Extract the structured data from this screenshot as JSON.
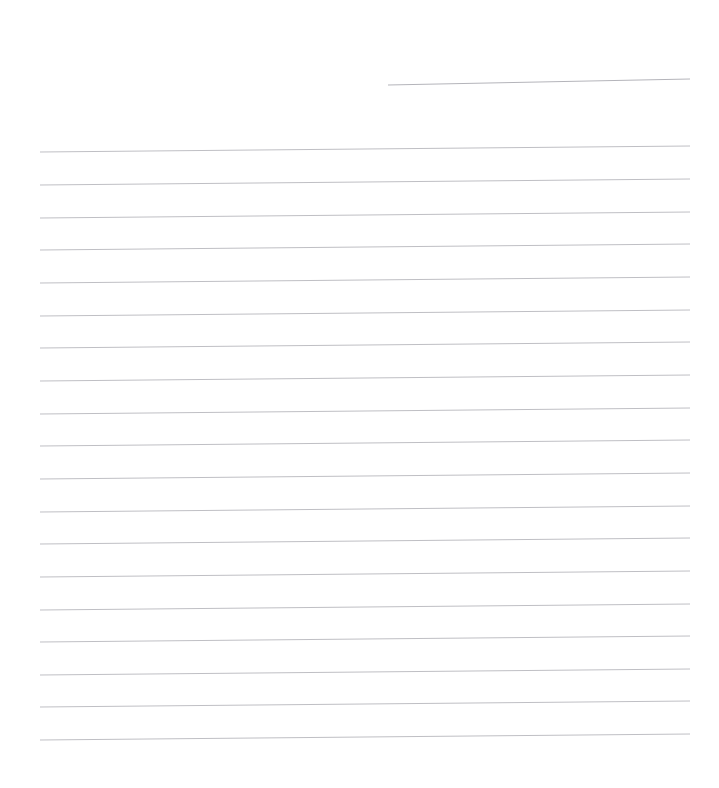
{
  "document": {
    "kind": "scanned-blank-ruled-paper",
    "title": "Blank Ruled Paper Scan",
    "page_width": 719,
    "page_height": 788,
    "background_color": "#ffffff",
    "has_text_content": false,
    "visible_text": ""
  },
  "paper": {
    "rule_color": "#bfbfc4",
    "rule_thickness": 1,
    "rule_left_x": 40,
    "rule_right_x": 690,
    "rule_spacing": 32.5,
    "first_full_rule_y": 150,
    "last_full_rule_y": 738,
    "full_rule_count": 19,
    "skew_rise_px": 6,
    "skew_direction": "up-to-the-right"
  },
  "partial_rule": {
    "color": "#b4b4ba",
    "x_start": 388,
    "x_end": 690,
    "y_start": 85,
    "y_end": 79,
    "label": "short partial rule at top right"
  },
  "rules": [
    {
      "id": "rule-partial-top",
      "x1": 388,
      "y1": 85,
      "x2": 690,
      "y2": 79,
      "partial": true
    },
    {
      "id": "rule-01",
      "x1": 40,
      "y1": 152,
      "x2": 690,
      "y2": 146,
      "partial": false
    },
    {
      "id": "rule-02",
      "x1": 40,
      "y1": 185,
      "x2": 690,
      "y2": 179,
      "partial": false
    },
    {
      "id": "rule-03",
      "x1": 40,
      "y1": 218,
      "x2": 690,
      "y2": 212,
      "partial": false
    },
    {
      "id": "rule-04",
      "x1": 40,
      "y1": 250,
      "x2": 690,
      "y2": 244,
      "partial": false
    },
    {
      "id": "rule-05",
      "x1": 40,
      "y1": 283,
      "x2": 690,
      "y2": 277,
      "partial": false
    },
    {
      "id": "rule-06",
      "x1": 40,
      "y1": 316,
      "x2": 690,
      "y2": 310,
      "partial": false
    },
    {
      "id": "rule-07",
      "x1": 40,
      "y1": 348,
      "x2": 690,
      "y2": 342,
      "partial": false
    },
    {
      "id": "rule-08",
      "x1": 40,
      "y1": 381,
      "x2": 690,
      "y2": 375,
      "partial": false
    },
    {
      "id": "rule-09",
      "x1": 40,
      "y1": 414,
      "x2": 690,
      "y2": 408,
      "partial": false
    },
    {
      "id": "rule-10",
      "x1": 40,
      "y1": 446,
      "x2": 690,
      "y2": 440,
      "partial": false
    },
    {
      "id": "rule-11",
      "x1": 40,
      "y1": 479,
      "x2": 690,
      "y2": 473,
      "partial": false
    },
    {
      "id": "rule-12",
      "x1": 40,
      "y1": 512,
      "x2": 690,
      "y2": 506,
      "partial": false
    },
    {
      "id": "rule-13",
      "x1": 40,
      "y1": 544,
      "x2": 690,
      "y2": 538,
      "partial": false
    },
    {
      "id": "rule-14",
      "x1": 40,
      "y1": 577,
      "x2": 690,
      "y2": 571,
      "partial": false
    },
    {
      "id": "rule-15",
      "x1": 40,
      "y1": 610,
      "x2": 690,
      "y2": 604,
      "partial": false
    },
    {
      "id": "rule-16",
      "x1": 40,
      "y1": 642,
      "x2": 690,
      "y2": 636,
      "partial": false
    },
    {
      "id": "rule-17",
      "x1": 40,
      "y1": 675,
      "x2": 690,
      "y2": 669,
      "partial": false
    },
    {
      "id": "rule-18",
      "x1": 40,
      "y1": 707,
      "x2": 690,
      "y2": 701,
      "partial": false
    },
    {
      "id": "rule-19",
      "x1": 40,
      "y1": 740,
      "x2": 690,
      "y2": 734,
      "partial": false
    }
  ],
  "margins": {
    "top_blank_height": 150,
    "bottom_blank_height": 48,
    "left_blank_width": 40,
    "right_blank_width": 29
  }
}
